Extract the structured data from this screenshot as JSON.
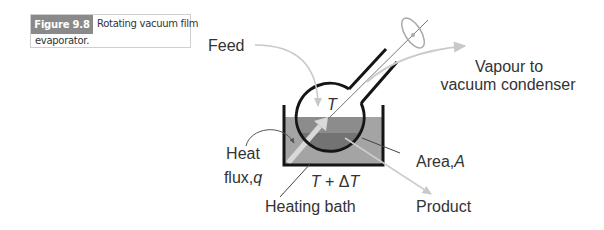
{
  "caption": {
    "label": "Figure 9.8",
    "text_line1": "Rotating vacuum film",
    "text_line2": "evaporator."
  },
  "diagram": {
    "labels": {
      "feed": "Feed",
      "vapour_line1": "Vapour to",
      "vapour_line2": "vacuum condenser",
      "flask_temp": "T",
      "heat_line1": "Heat",
      "heat_line2_prefix": "flux,",
      "heat_line2_var": "q",
      "area_prefix": "Area,",
      "area_var": "A",
      "bath_temp_var1": "T",
      "bath_temp_op": " + Δ",
      "bath_temp_var2": "T",
      "heating_bath": "Heating bath",
      "product": "Product"
    },
    "colors": {
      "bath_liquid": "#a4a4a4",
      "flask_liquid_upper": "#8c8c8c",
      "flask_liquid_film": "#737373",
      "outline": "#151515",
      "light_arrow": "#cccccc",
      "heat_arrow": "#d9d9d9",
      "caption_label_bg": "#8a8a8a",
      "text": "#333333"
    }
  }
}
